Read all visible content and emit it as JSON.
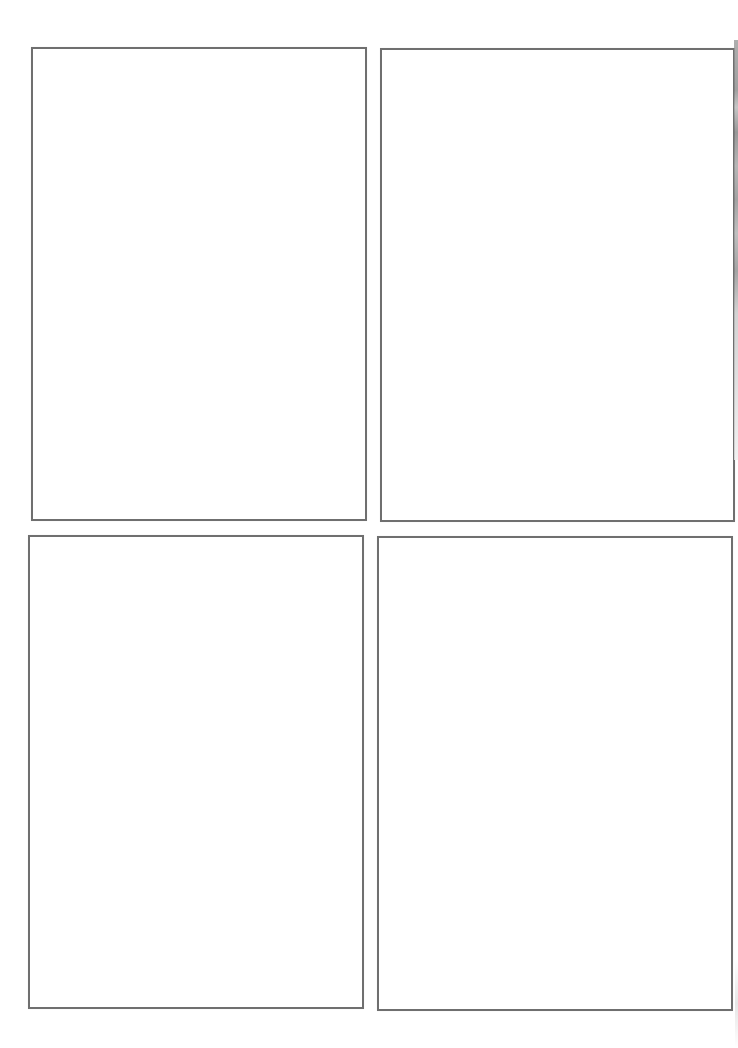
{
  "page": {
    "type": "blank storyboard / drawing template",
    "header_text_visible": false,
    "header_text": "",
    "border_color": "#6f6f6f",
    "background_color": "#ffffff"
  },
  "frames": [
    {
      "id": "top-left",
      "row": 1,
      "col": 1,
      "x": 31,
      "y": 47,
      "width": 336,
      "height": 474,
      "content": ""
    },
    {
      "id": "top-right",
      "row": 1,
      "col": 2,
      "x": 380,
      "y": 48,
      "width": 355,
      "height": 474,
      "content": ""
    },
    {
      "id": "bottom-left",
      "row": 2,
      "col": 1,
      "x": 28,
      "y": 535,
      "width": 336,
      "height": 474,
      "content": ""
    },
    {
      "id": "bottom-right",
      "row": 2,
      "col": 2,
      "x": 377,
      "y": 536,
      "width": 356,
      "height": 475,
      "content": ""
    }
  ]
}
